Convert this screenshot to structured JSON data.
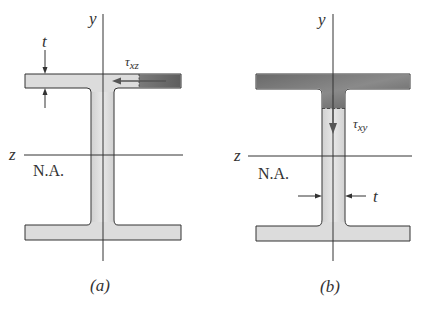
{
  "figure": {
    "panels": [
      {
        "id": "a",
        "caption": "(a)",
        "y_axis_label": "y",
        "z_axis_label": "z",
        "neutral_axis_label": "N.A.",
        "stress_symbol": "τ",
        "stress_subscript": "xz",
        "thickness_label": "t",
        "description": "Horizontal shear stress tau_xz in the flange, thickness t of flange"
      },
      {
        "id": "b",
        "caption": "(b)",
        "y_axis_label": "y",
        "z_axis_label": "z",
        "neutral_axis_label": "N.A.",
        "stress_symbol": "τ",
        "stress_subscript": "xy",
        "thickness_label": "t",
        "description": "Vertical shear stress tau_xy in the web, thickness t of web"
      }
    ],
    "colors": {
      "section_fill": "#d9d9d9",
      "section_dark": "#6e6e6e",
      "outline": "#333333",
      "arrow": "#555555"
    }
  }
}
